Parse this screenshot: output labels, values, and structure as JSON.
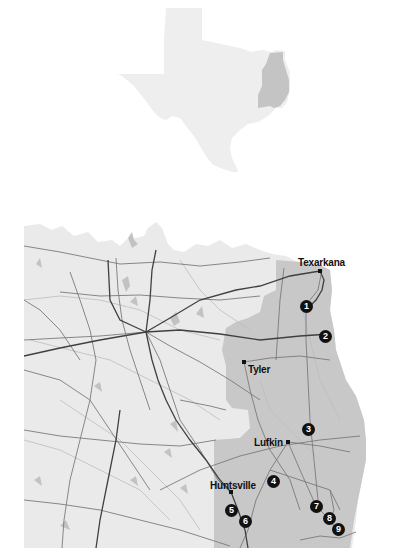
{
  "inset_map": {
    "region": "Texas",
    "highlight": "East Texas",
    "colors": {
      "state": "#eeeeee",
      "highlight": "#c4c4c4"
    }
  },
  "main_map": {
    "colors": {
      "land": "#eaeaea",
      "region": "#c8c8c8",
      "lake": "#c2c2c2",
      "major_road": "#404040",
      "minor_road": "#7a7a7a",
      "water_line": "#bdbdbd"
    },
    "cities": [
      {
        "name": "Texarkana",
        "x": 320,
        "y": 271
      },
      {
        "name": "Tyler",
        "x": 244,
        "y": 362
      },
      {
        "name": "Lufkin",
        "x": 288,
        "y": 442
      },
      {
        "name": "Huntsville",
        "x": 231,
        "y": 492
      }
    ],
    "markers": [
      {
        "label": "1",
        "x": 306,
        "y": 306
      },
      {
        "label": "2",
        "x": 325,
        "y": 336
      },
      {
        "label": "3",
        "x": 308,
        "y": 429
      },
      {
        "label": "4",
        "x": 273,
        "y": 481
      },
      {
        "label": "5",
        "x": 231,
        "y": 510
      },
      {
        "label": "6",
        "x": 245,
        "y": 521
      },
      {
        "label": "7",
        "x": 316,
        "y": 506
      },
      {
        "label": "8",
        "x": 329,
        "y": 518
      },
      {
        "label": "9",
        "x": 338,
        "y": 529
      }
    ]
  }
}
